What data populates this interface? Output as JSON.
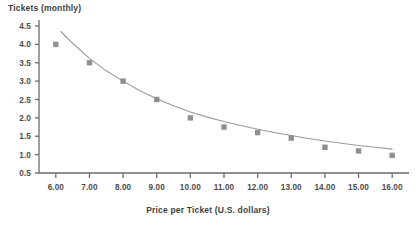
{
  "chart_data": {
    "type": "scatter",
    "title": "",
    "ylabel": "Tickets (monthly)",
    "xlabel": "Price per Ticket (U.S. dollars)",
    "xlim": [
      5.5,
      16.5
    ],
    "ylim": [
      0.5,
      4.5
    ],
    "grid": false,
    "legend": "none",
    "marker_color": "#8f8f8f",
    "curve_color": "#9a9a9a",
    "axis_color": "#6b6b6b",
    "x": [
      6,
      7,
      8,
      9,
      10,
      11,
      12,
      13,
      14,
      15,
      16
    ],
    "xticklabels": [
      "6.00",
      "7.00",
      "8.00",
      "9.00",
      "10.00",
      "11.00",
      "12.00",
      "13.00",
      "14.00",
      "15.00",
      "16.00"
    ],
    "yticklabels": [
      "0.5",
      "1.0",
      "1.5",
      "2.0",
      "2.5",
      "3.0",
      "3.5",
      "4.0",
      "4.5"
    ],
    "yticks": [
      0.5,
      1.0,
      1.5,
      2.0,
      2.5,
      3.0,
      3.5,
      4.0,
      4.5
    ],
    "series": [
      {
        "name": "Tickets demanded",
        "values": [
          4.0,
          3.5,
          3.0,
          2.5,
          2.0,
          1.75,
          1.6,
          1.45,
          1.2,
          1.1,
          0.98
        ]
      }
    ],
    "fitted_curve": {
      "name": "fitted demand curve",
      "x": [
        6.15,
        6.5,
        7.0,
        7.5,
        8.0,
        8.5,
        9.0,
        9.5,
        10.0,
        10.5,
        11.0,
        11.5,
        12.0,
        12.5,
        13.0,
        13.5,
        14.0,
        14.5,
        15.0,
        15.5,
        16.0
      ],
      "y": [
        4.35,
        4.03,
        3.62,
        3.28,
        3.0,
        2.74,
        2.52,
        2.33,
        2.16,
        2.02,
        1.9,
        1.79,
        1.69,
        1.6,
        1.52,
        1.44,
        1.37,
        1.31,
        1.25,
        1.2,
        1.15
      ]
    }
  }
}
